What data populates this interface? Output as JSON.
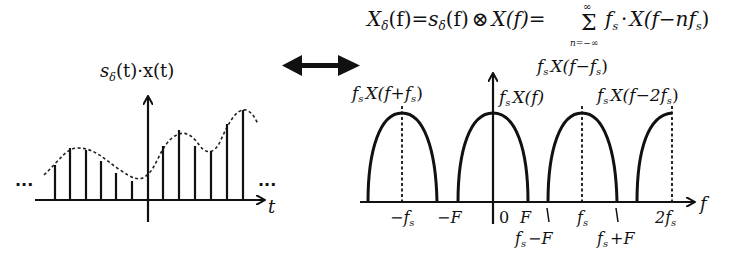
{
  "formula": {
    "lhs": "X",
    "lhs_sub": "δ",
    "arg": "(f)",
    "eq1": "=",
    "s": "s",
    "s_sub": "δ",
    "s_arg": "(f)",
    "conv": "⊗",
    "X2": "X(f)",
    "eq2": "=",
    "sum": "Σ",
    "sum_upper": "∞",
    "sum_lower": "n=−∞",
    "rhs": "f",
    "rhs_sub": "s",
    "rhs_dot": "·",
    "rhs_x": "X(f−nf",
    "rhs_x_sub": "s",
    "rhs_close": ")"
  },
  "arrow": {
    "name": "double-arrow",
    "meaning": "transform pair"
  },
  "time_plot": {
    "title": "s",
    "title_sub": "δ",
    "title_rest": "(t)·x(t)",
    "xlabel": "t",
    "ellipsis_left": "···",
    "ellipsis_right": "···",
    "samples_x": [
      55,
      70,
      86,
      101,
      116,
      132,
      163,
      179,
      195,
      211,
      227,
      243
    ],
    "samples_top": [
      165,
      148,
      150,
      161,
      173,
      181,
      146,
      130,
      146,
      151,
      124,
      110
    ]
  },
  "freq_plot": {
    "xlabel": "f",
    "labels_top": [
      {
        "text": "f",
        "sub": "s",
        "rest": "X(f+f",
        "sub2": "s",
        "close": ")"
      },
      {
        "text": "f",
        "sub": "s",
        "rest": "X(f)"
      },
      {
        "text": "f",
        "sub": "s",
        "rest": "X(f−f",
        "sub2": "s",
        "close": ")"
      },
      {
        "text": "f",
        "sub": "s",
        "rest": "X(f−2f",
        "sub2": "s",
        "close": ")"
      }
    ],
    "ticks": [
      {
        "label": "−f",
        "sub": "s"
      },
      {
        "label": "−F"
      },
      {
        "label": "0"
      },
      {
        "label": "F"
      },
      {
        "label": "f",
        "sub": "s"
      },
      {
        "label": "2f",
        "sub": "s"
      }
    ],
    "ticks_below": [
      {
        "label": "f",
        "sub": "s",
        "rest": "−F"
      },
      {
        "label": "f",
        "sub": "s",
        "rest": "+F"
      }
    ]
  }
}
